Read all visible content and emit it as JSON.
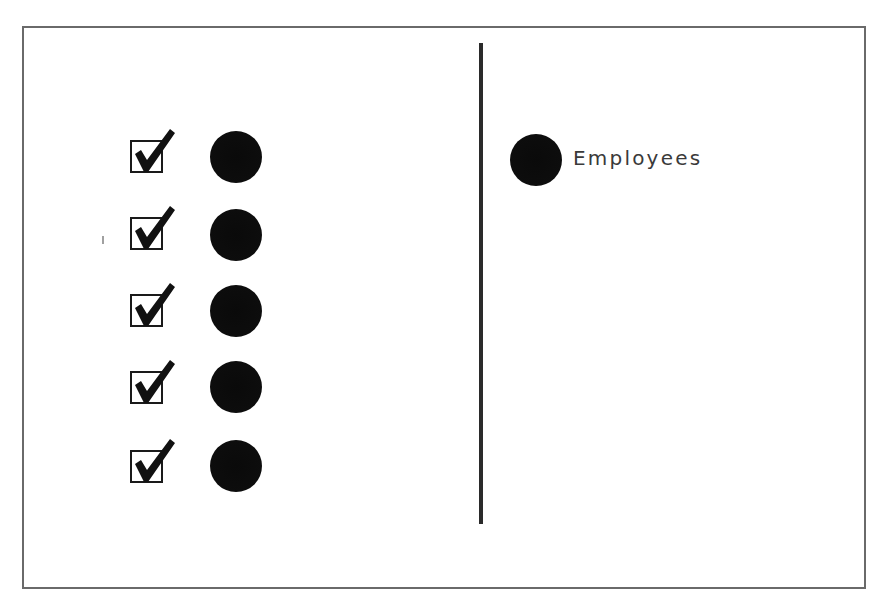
{
  "diagram": {
    "caption_cut_off": "",
    "left_panel": {
      "rows": [
        {
          "checked": true,
          "marker": "filled-black-circle"
        },
        {
          "checked": true,
          "marker": "filled-black-circle"
        },
        {
          "checked": true,
          "marker": "filled-black-circle"
        },
        {
          "checked": true,
          "marker": "filled-black-circle"
        },
        {
          "checked": true,
          "marker": "filled-black-circle"
        }
      ]
    },
    "legend": {
      "items": [
        {
          "marker": "filled-black-circle",
          "label": "Employees"
        }
      ]
    },
    "colors": {
      "frame": "#6a6a6a",
      "divider": "#2a2a2a",
      "marker": "#0d0d0d",
      "checkbox": "#1a1a1a",
      "label": "#3a3a3a"
    }
  }
}
